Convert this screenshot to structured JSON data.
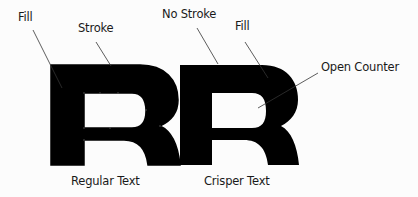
{
  "diagram": {
    "callouts": {
      "fill_left": "Fill",
      "stroke": "Stroke",
      "no_stroke": "No Stroke",
      "fill_right": "Fill",
      "open_counter": "Open Counter"
    },
    "captions": {
      "left": "Regular Text",
      "right": "Crisper Text"
    },
    "glyphs": {
      "left": "R",
      "right": "R"
    },
    "colors": {
      "glyph": "#000000",
      "leader_line": "#333333",
      "background": "#fcfcfc"
    }
  }
}
